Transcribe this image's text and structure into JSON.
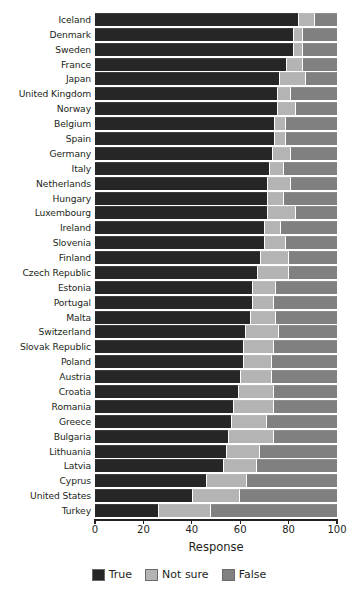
{
  "chart_data": {
    "type": "bar",
    "orientation": "horizontal",
    "stacked": true,
    "title": "",
    "xlabel": "Response",
    "ylabel": "",
    "xlim": [
      0,
      100
    ],
    "xticks": [
      0,
      20,
      40,
      60,
      80,
      100
    ],
    "grid": false,
    "legend_position": "bottom",
    "categories": [
      "Iceland",
      "Denmark",
      "Sweden",
      "France",
      "Japan",
      "United Kingdom",
      "Norway",
      "Belgium",
      "Spain",
      "Germany",
      "Italy",
      "Netherlands",
      "Hungary",
      "Luxembourg",
      "Ireland",
      "Slovenia",
      "Finland",
      "Czech Republic",
      "Estonia",
      "Portugal",
      "Malta",
      "Switzerland",
      "Slovak Republic",
      "Poland",
      "Austria",
      "Croatia",
      "Romania",
      "Greece",
      "Bulgaria",
      "Lithuania",
      "Latvia",
      "Cyprus",
      "United States",
      "Turkey"
    ],
    "series": [
      {
        "name": "True",
        "color": "#262626",
        "values": [
          84,
          82,
          82,
          79,
          76,
          75,
          75,
          74,
          74,
          73,
          72,
          71,
          71,
          71,
          70,
          70,
          68,
          67,
          65,
          65,
          64,
          62,
          61,
          61,
          60,
          59,
          57,
          56,
          55,
          54,
          53,
          46,
          40,
          26
        ]
      },
      {
        "name": "Not sure",
        "color": "#b4b4b4",
        "values": [
          7,
          4,
          4,
          7,
          11,
          6,
          8,
          5,
          5,
          8,
          6,
          10,
          7,
          12,
          7,
          9,
          12,
          13,
          10,
          9,
          11,
          14,
          13,
          12,
          13,
          15,
          17,
          15,
          19,
          14,
          14,
          17,
          20,
          22
        ]
      },
      {
        "name": "False",
        "color": "#808080",
        "values": [
          9,
          14,
          14,
          14,
          13,
          19,
          17,
          21,
          21,
          19,
          22,
          19,
          22,
          17,
          23,
          21,
          20,
          20,
          25,
          26,
          25,
          24,
          26,
          27,
          27,
          26,
          26,
          29,
          26,
          32,
          33,
          37,
          40,
          52
        ]
      }
    ]
  },
  "axis": {
    "x_title": "Response",
    "tick_labels": [
      "0",
      "20",
      "40",
      "60",
      "80",
      "100"
    ]
  },
  "legend": {
    "items": [
      {
        "label": "True",
        "color": "#262626"
      },
      {
        "label": "Not sure",
        "color": "#b4b4b4"
      },
      {
        "label": "False",
        "color": "#808080"
      }
    ]
  }
}
